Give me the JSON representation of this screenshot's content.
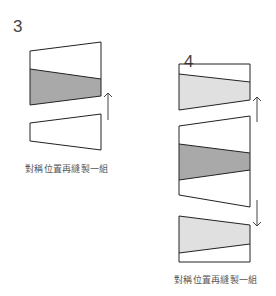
{
  "steps": [
    {
      "number": "3",
      "caption": "對稱位置再縫製一組"
    },
    {
      "number": "4",
      "caption": "對稱位置再縫製一組"
    }
  ],
  "colors": {
    "dark_fill": "#a9a9a9",
    "light_fill": "#e0e0e0",
    "stroke": "#222222"
  }
}
